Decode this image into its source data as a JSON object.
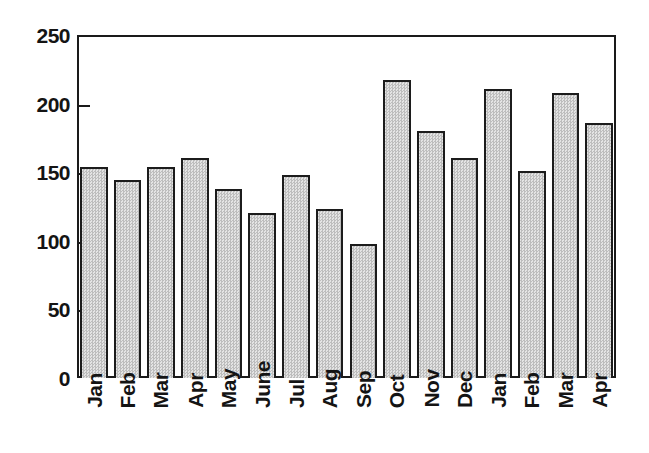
{
  "chart_data": {
    "type": "bar",
    "title": "",
    "subtitle": "",
    "xlabel": "",
    "ylabel": "",
    "categories": [
      "Jan",
      "Feb",
      "Mar",
      "Apr",
      "May",
      "June",
      "Jul",
      "Aug",
      "Sep",
      "Oct",
      "Nov",
      "Dec",
      "Jan",
      "Feb",
      "Mar",
      "Apr"
    ],
    "values": [
      154,
      144,
      154,
      160,
      138,
      120,
      148,
      123,
      98,
      217,
      180,
      160,
      211,
      151,
      208,
      186
    ],
    "ylim": [
      0,
      250
    ],
    "yticks": [
      0,
      50,
      100,
      150,
      200,
      250
    ],
    "ytick_labels": [
      "0",
      "50",
      "100",
      "150",
      "200",
      "250"
    ],
    "grid": false,
    "legend": null,
    "legend_position": "none",
    "series": [
      {
        "name": "",
        "values": [
          154,
          144,
          154,
          160,
          138,
          120,
          148,
          123,
          98,
          217,
          180,
          160,
          211,
          151,
          208,
          186
        ]
      }
    ],
    "annotations": [],
    "bar_fill_color": "#d3d3d3",
    "bar_edge_color": "#1c1c1c",
    "axis_color": "#1a1a1a",
    "background_color": "#ffffff"
  }
}
